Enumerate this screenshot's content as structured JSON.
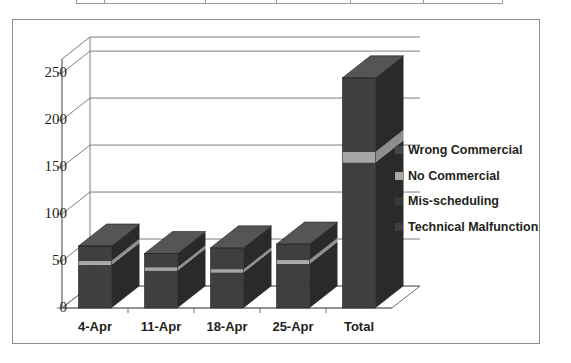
{
  "chart_data": {
    "type": "bar",
    "title": "",
    "xlabel": "",
    "ylabel": "",
    "stacked": true,
    "grid": true,
    "legend_position": "right",
    "ylim": [
      0,
      250
    ],
    "yticks": [
      "0",
      "50",
      "100",
      "150",
      "200",
      "250"
    ],
    "ytick_values": [
      0,
      50,
      100,
      150,
      200,
      250
    ],
    "categories": [
      "4-Apr",
      "11-Apr",
      "18-Apr",
      "25-Apr",
      "Total"
    ],
    "series": [
      {
        "name": "Technical Malfunction",
        "color": "#3d3d3d",
        "values": [
          46,
          40,
          38,
          47,
          155
        ]
      },
      {
        "name": "Mis-scheduling",
        "color": "#3a3a3a",
        "values": [
          0,
          0,
          0,
          0,
          0
        ]
      },
      {
        "name": "No Commercial",
        "color": "#a6a6a6",
        "values": [
          4,
          3,
          3,
          4,
          11
        ]
      },
      {
        "name": "Wrong Commercial",
        "color": "#464646",
        "values": [
          16,
          15,
          23,
          17,
          79
        ]
      }
    ],
    "totals": [
      66,
      58,
      64,
      68,
      245
    ]
  },
  "legend": {
    "items": [
      {
        "label": "Wrong Commercial",
        "color": "#464646"
      },
      {
        "label": "No Commercial",
        "color": "#a6a6a6"
      },
      {
        "label": "Mis-scheduling",
        "color": "#3a3a3a"
      },
      {
        "label": "Technical Malfunction",
        "color": "#3d3d3d"
      }
    ]
  },
  "colors": {
    "frame_border": "#8d8d8d",
    "gridline": "#7d7d7d",
    "axis": "#6f6f6f",
    "bar_front": "#3f3f3f",
    "bar_side": "#2a2a2a",
    "bar_top": "#555555",
    "stripe": "#a6a6a6",
    "text": "#231f20",
    "background": "#ffffff"
  },
  "table_fragment": {
    "visible": true,
    "column_widths": [
      28,
      102,
      71,
      74,
      74,
      78
    ]
  }
}
